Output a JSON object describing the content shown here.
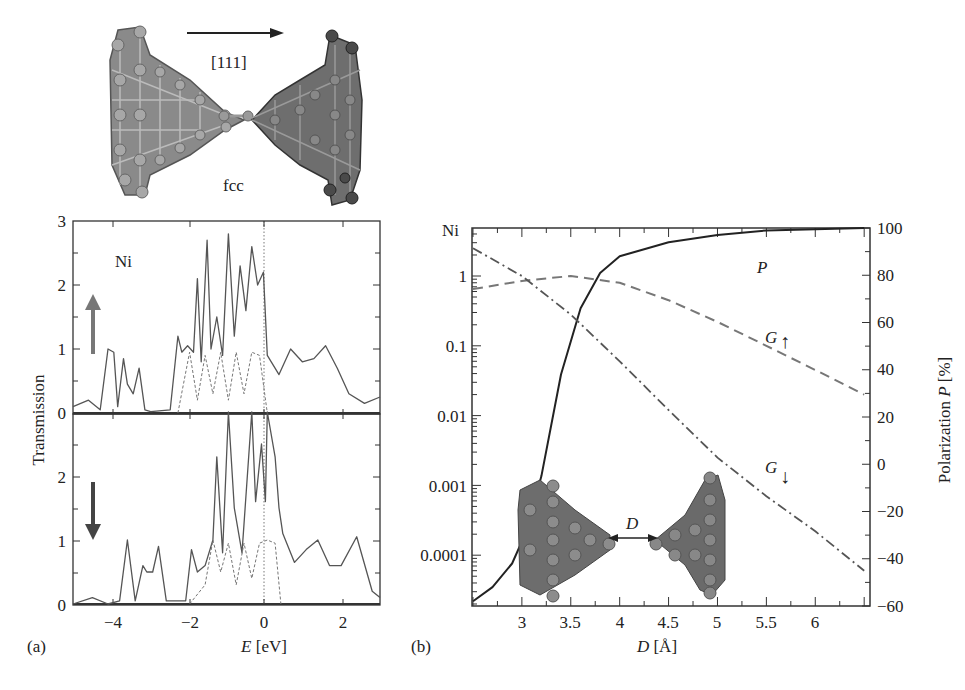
{
  "figure": {
    "top_image": {
      "direction_label": "[111]",
      "structure_label": "fcc"
    },
    "panel_a": {
      "panel_label": "(a)",
      "element_label": "Ni",
      "ylabel": "Transmission",
      "xlabel_var": "E",
      "xlabel_unit": " [eV]",
      "x_ticks": [
        "−4",
        "−2",
        "0",
        "2"
      ],
      "y_ticks_top": [
        "0",
        "1",
        "2",
        "3"
      ],
      "y_ticks_bottom": [
        "0",
        "1",
        "2"
      ],
      "spin_up_symbol": "↑",
      "spin_down_symbol": "↓"
    },
    "panel_b": {
      "panel_label": "(b)",
      "element_label": "Ni",
      "xlabel_var": "D",
      "xlabel_unit": " [Å]",
      "ylabel_right_prefix": "Polarization ",
      "ylabel_right_var": "P",
      "ylabel_right_unit": " [%]",
      "x_ticks": [
        "3",
        "3.5",
        "4",
        "4.5",
        "5",
        "5.5",
        "6"
      ],
      "y_ticks_left": [
        "1",
        "0.1",
        "0.01",
        "0.001",
        "0.0001"
      ],
      "y_ticks_right": [
        "100",
        "80",
        "60",
        "40",
        "20",
        "0",
        "−20",
        "−40",
        "−60"
      ],
      "curve_label_P": "P",
      "curve_label_Gup": "G",
      "curve_label_Gup_arrow": "↑",
      "curve_label_Gdown": "G",
      "curve_label_Gdown_arrow": "↓",
      "inset_distance_label": "D"
    }
  },
  "chart_data": [
    {
      "type": "line",
      "title": "(a) Ni spin-up transmission",
      "xlabel": "E [eV]",
      "ylabel": "Transmission",
      "xlim": [
        -5,
        2.9
      ],
      "ylim": [
        0,
        3
      ],
      "annotations": [
        "Ni",
        "spin-up arrow",
        "dotted vertical line at E=0"
      ],
      "series": [
        {
          "name": "total (solid)",
          "x": [
            -5,
            -4.6,
            -4.3,
            -4.1,
            -3.95,
            -3.85,
            -3.7,
            -3.6,
            -3.45,
            -3.3,
            -3.15,
            -3.0,
            -2.5,
            -2.3,
            -2.2,
            -2.05,
            -1.9,
            -1.8,
            -1.7,
            -1.55,
            -1.45,
            -1.3,
            -1.15,
            -1.0,
            -0.85,
            -0.7,
            -0.55,
            -0.4,
            -0.25,
            -0.1,
            0,
            0.3,
            0.6,
            0.9,
            1.2,
            1.5,
            1.8,
            2.1,
            2.5,
            2.9
          ],
          "y": [
            0.1,
            0.2,
            0.05,
            1.0,
            0.95,
            0.1,
            0.85,
            0.45,
            0.3,
            0.7,
            0.05,
            0.02,
            0.05,
            1.2,
            0.95,
            1.05,
            0.95,
            2.1,
            0.8,
            2.7,
            1.0,
            1.5,
            0.9,
            2.8,
            1.2,
            2.3,
            1.6,
            2.6,
            2.0,
            2.2,
            0.9,
            0.6,
            1.0,
            0.8,
            0.85,
            1.05,
            0.7,
            0.3,
            0.15,
            0.25
          ]
        },
        {
          "name": "channel contributions (dashed)",
          "x": [
            -2.3,
            -2.0,
            -1.8,
            -1.6,
            -1.4,
            -1.2,
            -1.0,
            -0.8,
            -0.6,
            -0.4,
            -0.2,
            0
          ],
          "y": [
            0.0,
            0.95,
            0.2,
            0.9,
            0.3,
            0.95,
            0.2,
            0.95,
            0.3,
            0.95,
            0.9,
            0.0
          ]
        }
      ]
    },
    {
      "type": "line",
      "title": "(a) Ni spin-down transmission",
      "xlabel": "E [eV]",
      "ylabel": "Transmission",
      "xlim": [
        -5,
        2.9
      ],
      "ylim": [
        0,
        3
      ],
      "annotations": [
        "spin-down arrow",
        "dotted vertical line at E=0"
      ],
      "series": [
        {
          "name": "total (solid)",
          "x": [
            -5,
            -4.5,
            -4.1,
            -3.8,
            -3.6,
            -3.4,
            -3.2,
            -3.1,
            -2.95,
            -2.8,
            -2.6,
            -2.1,
            -1.95,
            -1.8,
            -1.6,
            -1.4,
            -1.3,
            -1.15,
            -1.0,
            -0.85,
            -0.65,
            -0.4,
            -0.3,
            -0.15,
            -0.05,
            0,
            0.2,
            0.3,
            0.4,
            0.7,
            1.0,
            1.3,
            1.6,
            1.9,
            2.3,
            2.7,
            2.9
          ],
          "y": [
            0.0,
            0.1,
            0.0,
            0.05,
            1.0,
            0.05,
            0.6,
            0.5,
            0.5,
            0.9,
            0.05,
            0.05,
            0.85,
            0.5,
            0.6,
            1.0,
            2.3,
            0.8,
            3.0,
            1.5,
            0.8,
            3.0,
            1.6,
            2.5,
            1.6,
            3.0,
            2.3,
            1.5,
            1.1,
            0.65,
            0.85,
            1.0,
            0.6,
            0.6,
            1.05,
            0.2,
            0.1
          ]
        },
        {
          "name": "channel contributions (dashed)",
          "x": [
            -2.0,
            -1.6,
            -1.4,
            -1.2,
            -1.0,
            -0.8,
            -0.6,
            -0.4,
            -0.2,
            0,
            0.2,
            0.35
          ],
          "y": [
            0.0,
            0.3,
            1.0,
            0.5,
            0.95,
            0.3,
            0.95,
            0.4,
            0.95,
            1.0,
            0.95,
            0.0
          ]
        }
      ]
    },
    {
      "type": "line",
      "title": "(b) Ni conductance and polarization vs electrode distance",
      "xlabel": "D [Å]",
      "ylabel": "Conductance (log scale)",
      "ylabel_right": "Polarization P [%]",
      "xlim": [
        2.5,
        6.55
      ],
      "ylim": [
        2e-05,
        5
      ],
      "yscale": "log",
      "ylim_right": [
        -60,
        100
      ],
      "legend": "inline labels: P, G↑, G↓",
      "series": [
        {
          "name": "P (solid, right axis)",
          "axis": "right",
          "x": [
            2.5,
            2.7,
            2.9,
            3.05,
            3.2,
            3.4,
            3.6,
            3.8,
            4.0,
            4.5,
            5.0,
            5.5,
            6.0,
            6.5
          ],
          "y": [
            -58,
            -52,
            -42,
            -28,
            -5,
            38,
            66,
            81,
            88,
            94,
            97,
            99,
            99.5,
            100
          ]
        },
        {
          "name": "G↑ (dashed, left axis)",
          "axis": "left",
          "x": [
            2.5,
            3.0,
            3.5,
            4.0,
            4.5,
            5.0,
            5.5,
            6.0,
            6.5
          ],
          "y": [
            0.65,
            0.85,
            1.0,
            0.8,
            0.45,
            0.22,
            0.1,
            0.045,
            0.02
          ]
        },
        {
          "name": "G↓ (dash-dot, left axis)",
          "axis": "left",
          "x": [
            2.5,
            3.0,
            3.5,
            4.0,
            4.5,
            5.0,
            5.5,
            6.0,
            6.5
          ],
          "y": [
            2.5,
            1.0,
            0.28,
            0.06,
            0.012,
            0.0025,
            0.0007,
            0.00022,
            6e-05
          ]
        }
      ]
    }
  ]
}
